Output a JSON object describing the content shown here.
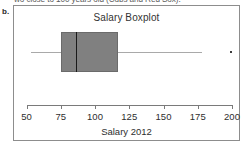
{
  "page": {
    "cut_off_text": "wo close to 100 years old (Cubs and Red Sox).",
    "part_label": "b."
  },
  "chart_data": {
    "type": "boxplot",
    "title": "Salary Boxplot",
    "xlabel": "Salary 2012",
    "ylabel": "",
    "orientation": "horizontal",
    "xlim": [
      43,
      208
    ],
    "grid": false,
    "legend": null,
    "ticks": [
      {
        "value": 50,
        "label": "50"
      },
      {
        "value": 75,
        "label": "75"
      },
      {
        "value": 100,
        "label": "100"
      },
      {
        "value": 125,
        "label": "125"
      },
      {
        "value": 150,
        "label": "150"
      },
      {
        "value": 175,
        "label": "175"
      },
      {
        "value": 200,
        "label": "200"
      }
    ],
    "boxes": [
      {
        "name": "Salary 2012",
        "whisker_low": 53,
        "q1": 75,
        "median": 86,
        "q3": 117,
        "whisker_high": 178,
        "outliers": [
          199
        ]
      }
    ],
    "colors": {
      "box_fill": "#808080",
      "box_border": "#6b6b6b",
      "median": "#1a1a1a",
      "whisker": "#a9a9a9",
      "outlier": "#3d3d3d",
      "axis": "#7a7a7a",
      "panel_border": "#8d8d8d",
      "background": "#ffffff"
    }
  }
}
